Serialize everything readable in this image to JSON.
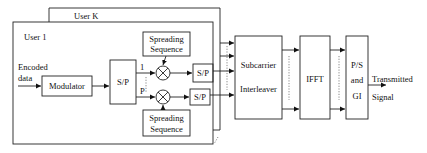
{
  "diagram": {
    "user_k_label": "User K",
    "user_1_label": "User 1",
    "input_label_line1": "Encoded",
    "input_label_line2": "data",
    "modulator": "Modulator",
    "sp_main": "S/P",
    "branch_1": "1",
    "branch_p": "P",
    "spreading_top_line1": "Spreading",
    "spreading_top_line2": "Sequence",
    "spreading_bottom_line1": "Spreading",
    "spreading_bottom_line2": "Sequence",
    "sp_top": "S/P",
    "sp_bottom": "S/P",
    "interleaver_line1": "Subcarrier",
    "interleaver_line2": "Interleaver",
    "ifft": "IFFT",
    "ps_line1": "P/S",
    "ps_line2": "and",
    "ps_line3": "GI",
    "output_line1": "Transmitted",
    "output_line2": "Signal"
  }
}
